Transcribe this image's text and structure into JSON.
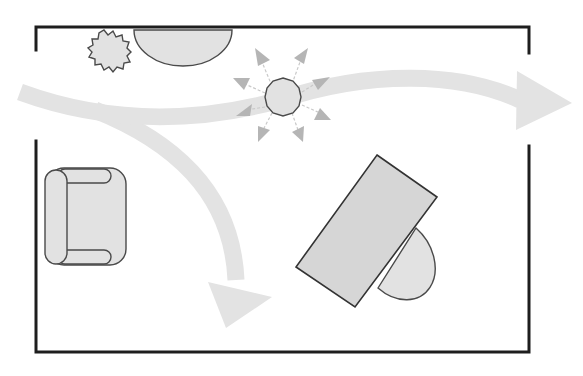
{
  "diagram": {
    "type": "floor-plan",
    "colors": {
      "wall": "#1e1e1e",
      "furniture_fill": "#d6d6d6",
      "furniture_stroke": "#333333",
      "flow_path": "#e3e3e3",
      "light_rays": "#b5b5b5",
      "background": "#ffffff"
    },
    "walls": {
      "top": "continuous top wall",
      "left_opening": "doorway gap on left wall",
      "right_opening": "doorway gap on right wall",
      "bottom": "continuous bottom wall"
    },
    "objects": [
      {
        "id": "plant",
        "label": "Potted plant",
        "icon": "plant-icon"
      },
      {
        "id": "half-round-table",
        "label": "Half-round console table",
        "icon": "half-circle-table-icon"
      },
      {
        "id": "ceiling-light",
        "label": "Ceiling light with radiating rays",
        "icon": "light-icon"
      },
      {
        "id": "armchair",
        "label": "Armchair",
        "icon": "armchair-icon"
      },
      {
        "id": "desk",
        "label": "Angled desk",
        "icon": "desk-icon"
      },
      {
        "id": "desk-chair",
        "label": "Desk chair",
        "icon": "chair-icon"
      }
    ],
    "flows": [
      {
        "id": "main-flow",
        "label": "Traffic path from left doorway to right doorway"
      },
      {
        "id": "branch-flow",
        "label": "Traffic path branching down into room"
      }
    ]
  }
}
